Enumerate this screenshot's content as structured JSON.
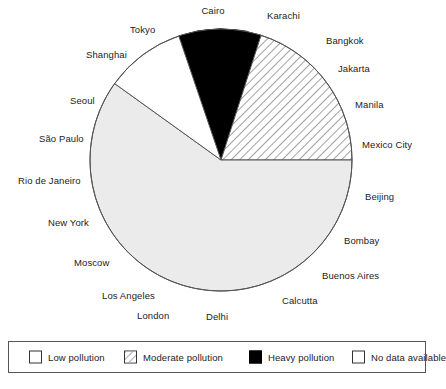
{
  "chart_data": {
    "type": "pie",
    "title": "",
    "subtitle": "",
    "center": {
      "x": 221,
      "y": 160
    },
    "radius": 131,
    "start_angle_deg": -18.8,
    "direction": "clockwise",
    "grid": false,
    "legend_position": "bottom",
    "categories": [
      "Heavy pollution",
      "Moderate pollution",
      "No data available",
      "Low pollution"
    ],
    "values": [
      10.2,
      20.0,
      59.9,
      9.9
    ],
    "slices": [
      {
        "label": "Heavy pollution",
        "value": 10.2,
        "start_deg": -18.8,
        "end_deg": 17.8,
        "fill": "#000000",
        "pattern": "solid",
        "stroke": "#000000"
      },
      {
        "label": "Moderate pollution",
        "value": 20.0,
        "start_deg": 17.8,
        "end_deg": 90.0,
        "fill": "#ffffff",
        "pattern": "diagonal-hatch",
        "stroke": "#555555"
      },
      {
        "label": "No data available",
        "value": 59.9,
        "start_deg": 90.0,
        "end_deg": 305.7,
        "fill": "#ebebeb",
        "pattern": "solid",
        "stroke": "#555555"
      },
      {
        "label": "Low pollution",
        "value": 9.9,
        "start_deg": 305.7,
        "end_deg": 341.2,
        "fill": "#ffffff",
        "pattern": "solid",
        "stroke": "#555555"
      }
    ],
    "annotations": [
      {
        "text": "Cairo",
        "x": 213,
        "y": 10,
        "align": "center"
      },
      {
        "text": "Karachi",
        "x": 267,
        "y": 15,
        "align": "left"
      },
      {
        "text": "Bangkok",
        "x": 326,
        "y": 40,
        "align": "left"
      },
      {
        "text": "Jakarta",
        "x": 338,
        "y": 68,
        "align": "left"
      },
      {
        "text": "Manila",
        "x": 355,
        "y": 104,
        "align": "left"
      },
      {
        "text": "Mexico City",
        "x": 362,
        "y": 144,
        "align": "left"
      },
      {
        "text": "Beijing",
        "x": 365,
        "y": 196,
        "align": "left"
      },
      {
        "text": "Bombay",
        "x": 344,
        "y": 240,
        "align": "left"
      },
      {
        "text": "Buenos Aires",
        "x": 322,
        "y": 275,
        "align": "left"
      },
      {
        "text": "Calcutta",
        "x": 282,
        "y": 300,
        "align": "left"
      },
      {
        "text": "Delhi",
        "x": 206,
        "y": 316,
        "align": "left"
      },
      {
        "text": "London",
        "x": 137,
        "y": 315,
        "align": "left"
      },
      {
        "text": "Los Angeles",
        "x": 102,
        "y": 295,
        "align": "left"
      },
      {
        "text": "Moscow",
        "x": 74,
        "y": 262,
        "align": "left"
      },
      {
        "text": "New York",
        "x": 48,
        "y": 222,
        "align": "left"
      },
      {
        "text": "Rio de Janeiro",
        "x": 18,
        "y": 180,
        "align": "left"
      },
      {
        "text": "São Paulo",
        "x": 39,
        "y": 138,
        "align": "left"
      },
      {
        "text": "Seoul",
        "x": 70,
        "y": 100,
        "align": "left"
      },
      {
        "text": "Shanghai",
        "x": 86,
        "y": 54,
        "align": "left"
      },
      {
        "text": "Tokyo",
        "x": 130,
        "y": 29,
        "align": "left"
      }
    ],
    "legend": [
      {
        "label": "Low pollution",
        "swatch": "white",
        "pattern": "solid"
      },
      {
        "label": "Moderate pollution",
        "swatch": "white",
        "pattern": "diagonal-hatch"
      },
      {
        "label": "Heavy pollution",
        "swatch": "black",
        "pattern": "solid"
      },
      {
        "label": "No data available",
        "swatch": "white",
        "pattern": "solid"
      }
    ]
  },
  "colors": {
    "heavy": "#000000",
    "moderate_fill": "#ffffff",
    "no_data": "#ebebeb",
    "low": "#ffffff",
    "outline": "#555555",
    "text": "#1c1c1c",
    "legend_border": "#555555"
  }
}
